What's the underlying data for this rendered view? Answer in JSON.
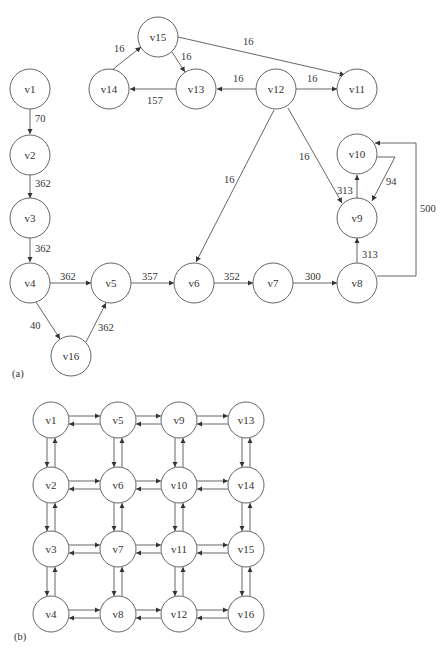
{
  "figure": {
    "panel_a": {
      "label": "(a)",
      "nodes": [
        {
          "id": "v1",
          "x": 30,
          "y": 89
        },
        {
          "id": "v2",
          "x": 30,
          "y": 155
        },
        {
          "id": "v3",
          "x": 30,
          "y": 218
        },
        {
          "id": "v4",
          "x": 30,
          "y": 283
        },
        {
          "id": "v5",
          "x": 111,
          "y": 283
        },
        {
          "id": "v6",
          "x": 194,
          "y": 283
        },
        {
          "id": "v7",
          "x": 273,
          "y": 283
        },
        {
          "id": "v8",
          "x": 357,
          "y": 283
        },
        {
          "id": "v9",
          "x": 357,
          "y": 218
        },
        {
          "id": "v10",
          "x": 357,
          "y": 154
        },
        {
          "id": "v11",
          "x": 156,
          "y": 89
        },
        {
          "id": "v12",
          "x": 76,
          "y": 89
        },
        {
          "id": "v13",
          "x": 196,
          "y": 89
        },
        {
          "id": "v14",
          "x": 109,
          "y": 89
        },
        {
          "id": "v15",
          "x": 158,
          "y": 37
        },
        {
          "id": "v16",
          "x": 71,
          "y": 356
        }
      ],
      "edges": [
        {
          "from": "v1",
          "to": "v2",
          "weight": "70"
        },
        {
          "from": "v2",
          "to": "v3",
          "weight": "362"
        },
        {
          "from": "v3",
          "to": "v4",
          "weight": "362"
        },
        {
          "from": "v4",
          "to": "v5",
          "weight": "362"
        },
        {
          "from": "v4",
          "to": "v16",
          "weight": "40"
        },
        {
          "from": "v16",
          "to": "v5",
          "weight": "362"
        },
        {
          "from": "v5",
          "to": "v6",
          "weight": "357"
        },
        {
          "from": "v6",
          "to": "v7",
          "weight": "352"
        },
        {
          "from": "v7",
          "to": "v8",
          "weight": "300"
        },
        {
          "from": "v8",
          "to": "v9",
          "weight": "313"
        },
        {
          "from": "v9",
          "to": "v10",
          "weight": "313"
        },
        {
          "from": "v10",
          "to": "v9",
          "weight": "94"
        },
        {
          "from": "v8",
          "to": "v10",
          "weight": "500"
        },
        {
          "from": "v12",
          "to": "v9",
          "weight": "16"
        },
        {
          "from": "v12",
          "to": "v6",
          "weight": "16"
        },
        {
          "from": "v12",
          "to": "v13",
          "weight": "16"
        },
        {
          "from": "v12",
          "to": "v11",
          "weight": "16"
        },
        {
          "from": "v13",
          "to": "v14",
          "weight": "157"
        },
        {
          "from": "v14",
          "to": "v15",
          "weight": "16"
        },
        {
          "from": "v15",
          "to": "v13",
          "weight": "16"
        },
        {
          "from": "v15",
          "to": "v11",
          "weight": "16"
        }
      ]
    },
    "panel_b": {
      "label": "(b)",
      "description": "4x4 grid of nodes with bidirectional edges between horizontal and vertical neighbors",
      "grid": [
        [
          "v1",
          "v5",
          "v9",
          "v13"
        ],
        [
          "v2",
          "v6",
          "v10",
          "v14"
        ],
        [
          "v3",
          "v7",
          "v11",
          "v15"
        ],
        [
          "v4",
          "v8",
          "v12",
          "v16"
        ]
      ]
    }
  }
}
